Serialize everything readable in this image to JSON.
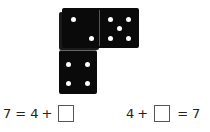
{
  "dominoes": {
    "horizontal": {
      "left_pips": 2,
      "right_pips": 5
    },
    "vertical": {
      "pips": 4
    }
  },
  "equations": [
    {
      "parts": [
        "7",
        "=",
        "4",
        "+"
      ],
      "blank_position": "end",
      "suffix": []
    },
    {
      "parts": [
        "4",
        "+"
      ],
      "blank_position": "middle",
      "suffix": [
        "=",
        "7"
      ]
    }
  ],
  "eq1": {
    "lhs": "7",
    "eq": "=",
    "a": "4",
    "plus": "+"
  },
  "eq2": {
    "a": "4",
    "plus": "+",
    "eq": "=",
    "rhs": "7"
  }
}
